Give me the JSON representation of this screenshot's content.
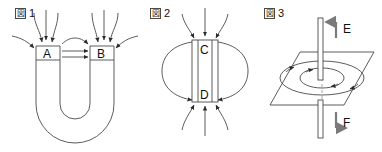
{
  "sheet": {
    "background_color": "#ffffff",
    "line_color": "#4a4a4a",
    "label_color": "#111111",
    "width": 382,
    "height": 152
  },
  "figures": [
    {
      "caption_kanji": "図",
      "caption_number": "1",
      "caption_full": "図 1",
      "subject": "horseshoe-magnet-field-lines",
      "labels": [
        {
          "text": "A",
          "role": "left-pole"
        },
        {
          "text": "B",
          "role": "right-pole"
        }
      ]
    },
    {
      "caption_kanji": "図",
      "caption_number": "2",
      "caption_full": "図 2",
      "subject": "bar-magnet-field-lines",
      "labels": [
        {
          "text": "C",
          "role": "top-pole"
        },
        {
          "text": "D",
          "role": "bottom-pole"
        }
      ]
    },
    {
      "caption_kanji": "図",
      "caption_number": "3",
      "caption_full": "図 3",
      "subject": "current-carrying-wire-circular-field",
      "labels": [
        {
          "text": "E",
          "role": "upper-arrow-label"
        },
        {
          "text": "F",
          "role": "lower-arrow-label"
        }
      ]
    }
  ]
}
